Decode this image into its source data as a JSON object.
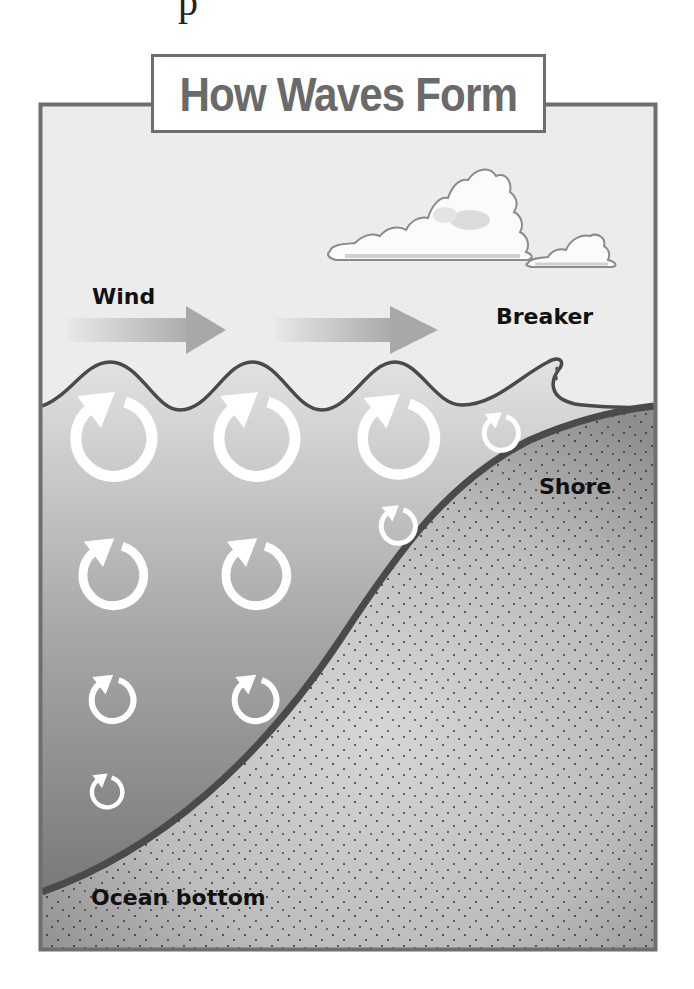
{
  "diagram": {
    "title": "How Waves Form",
    "top_fragment": "p",
    "labels": {
      "wind": "Wind",
      "breaker": "Breaker",
      "shore": "Shore",
      "ocean_bottom": "Ocean bottom"
    },
    "elements": {
      "clouds": 2,
      "wind_arrows": 2,
      "wave_crests": 3,
      "circular_orbit_arrows": 9
    },
    "colors": {
      "frame": "#6e6e6e",
      "title": "#6a6a6a",
      "sky": "#ececec",
      "water_top": "#dcdcdc",
      "water_bottom": "#7f7f7f",
      "sand": "#bdbdbd",
      "seafloor_line": "#4a4a4a",
      "orbit_arrow": "#ffffff"
    }
  }
}
